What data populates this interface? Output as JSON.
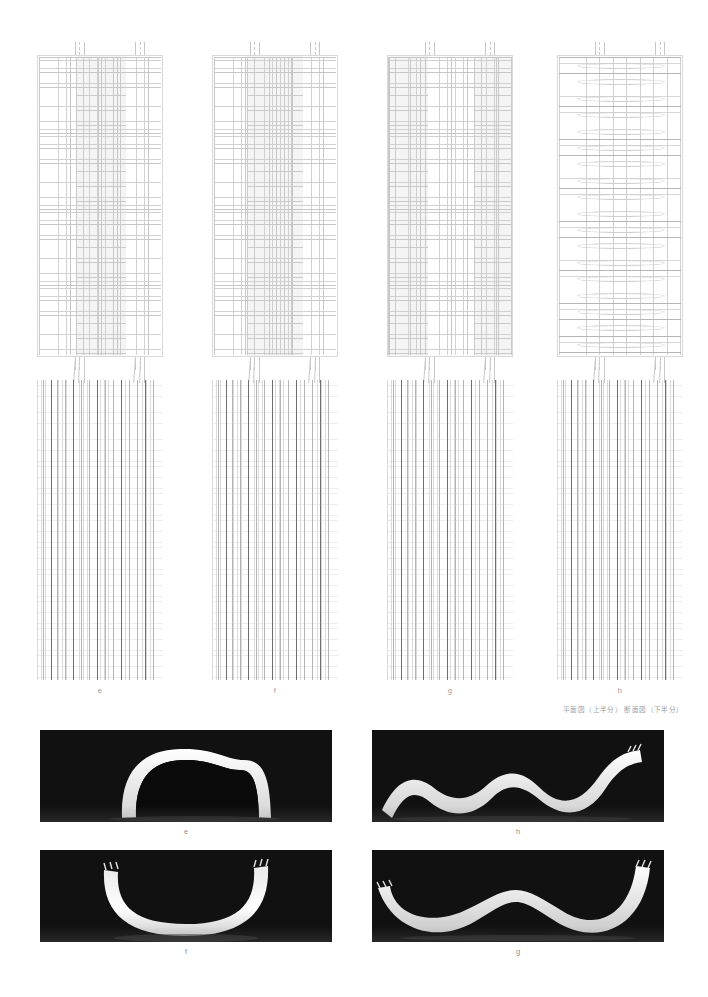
{
  "page": {
    "background": "#ffffff",
    "width": 708,
    "height": 997,
    "line_color": "#c8c8c8",
    "accent_line_color": "#6e6e6e",
    "label_color": "#9a9a9a"
  },
  "caption": {
    "japanese": "平面図（上半分） 断面図（下半分）"
  },
  "plans": [
    {
      "id": "e",
      "label": "e",
      "variant": "orthogonal-cells"
    },
    {
      "id": "f",
      "label": "f",
      "variant": "orthogonal-cells"
    },
    {
      "id": "g",
      "label": "g",
      "variant": "orthogonal-cells"
    },
    {
      "id": "h",
      "label": "h",
      "variant": "banded-lens"
    }
  ],
  "sections": [
    {
      "id": "e",
      "label": "e"
    },
    {
      "id": "f",
      "label": "f"
    },
    {
      "id": "g",
      "label": "g"
    },
    {
      "id": "h",
      "label": "h"
    }
  ],
  "figure_labels": [
    {
      "text": "e"
    },
    {
      "text": "f"
    },
    {
      "text": "g"
    },
    {
      "text": "h"
    }
  ],
  "photos": [
    {
      "id": "e",
      "label": "e",
      "form": "arch-dome",
      "position": "top-left"
    },
    {
      "id": "h",
      "label": "h",
      "form": "serpentine-wave",
      "position": "top-right"
    },
    {
      "id": "f",
      "label": "f",
      "form": "u-catenary",
      "position": "bottom-left"
    },
    {
      "id": "g",
      "label": "g",
      "form": "double-valley",
      "position": "bottom-right"
    }
  ]
}
